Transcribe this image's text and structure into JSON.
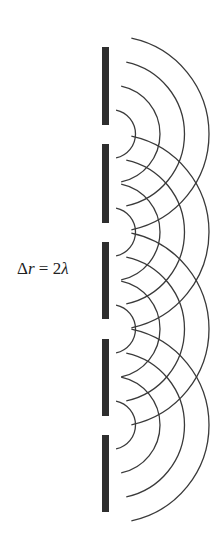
{
  "diagram": {
    "label": {
      "delta": "Δ",
      "var": "r",
      "eq": " = 2",
      "lambda": "λ"
    },
    "colors": {
      "barrier": "#2e2e2e",
      "wave": "#3a3a3a",
      "text": "#222222",
      "background": "#ffffff"
    },
    "barrier": {
      "x": 102,
      "width": 7,
      "segments": [
        {
          "y1": 47,
          "y2": 125
        },
        {
          "y1": 144,
          "y2": 223
        },
        {
          "y1": 242,
          "y2": 319
        },
        {
          "y1": 339,
          "y2": 416
        },
        {
          "y1": 435,
          "y2": 512
        }
      ]
    },
    "slits": [
      {
        "cx": 111,
        "cy": 134
      },
      {
        "cx": 111,
        "cy": 232
      },
      {
        "cx": 111,
        "cy": 329
      },
      {
        "cx": 111,
        "cy": 425
      }
    ],
    "wavefront_radii": [
      24.5,
      49,
      73.5,
      98
    ],
    "arc_half_angle_deg": 78
  }
}
